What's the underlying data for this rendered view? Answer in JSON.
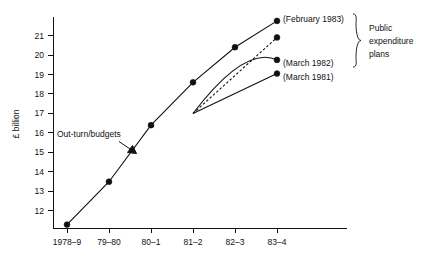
{
  "chart_data": {
    "type": "line",
    "title": "",
    "subtitle": "",
    "xlabel": "",
    "ylabel": "£ billion",
    "categories": [
      "1978–9",
      "79–80",
      "80–1",
      "81–2",
      "82–3",
      "83–4"
    ],
    "x_tick_labels": [
      "1978–9",
      "79–80",
      "80–1",
      "81–2",
      "82–3",
      "83–4"
    ],
    "y_tick_labels": [
      "12",
      "13",
      "14",
      "15",
      "16",
      "17",
      "18",
      "19",
      "20",
      "21"
    ],
    "y_tick_values": [
      12,
      13,
      14,
      15,
      16,
      17,
      18,
      19,
      20,
      21
    ],
    "ylim": [
      11.1,
      21.95
    ],
    "xlim": [
      0,
      5
    ],
    "grid": false,
    "legend_position": "right-inline",
    "series": [
      {
        "name": "Out-turn/budgets",
        "style": "solid",
        "x": [
          "1978–9",
          "79–80",
          "80–1",
          "81–2",
          "82–3",
          "83–4"
        ],
        "values": [
          11.3,
          13.5,
          16.4,
          18.6,
          20.4,
          21.75
        ],
        "end_label": "(February 1983)"
      },
      {
        "name": "(February 1983) plan branch",
        "style": "dashed",
        "x": [
          "81–2",
          "83–4"
        ],
        "values": [
          17.0,
          20.9
        ],
        "end_label": ""
      },
      {
        "name": "(March 1982)",
        "style": "solid-curved",
        "x": [
          "81–2",
          "83–4"
        ],
        "values": [
          17.0,
          19.75
        ],
        "end_label": "(March 1982)"
      },
      {
        "name": "(March 1981)",
        "style": "solid",
        "x": [
          "81–2",
          "83–4"
        ],
        "values": [
          17.0,
          19.05
        ],
        "end_label": "(March 1981)"
      }
    ],
    "annotations": [
      {
        "name": "out-turn-budgets",
        "text": "Out-turn/budgets",
        "target": "main-line between 79–80 and 80–1",
        "arrow": true
      },
      {
        "name": "public-expenditure-plans",
        "text_lines": [
          "Public",
          "expenditure",
          "plans"
        ],
        "brace": true
      }
    ]
  },
  "labels": {
    "y_axis_title": "£ billion",
    "annotation_outturn": "Out-turn/budgets",
    "series_feb_1983": "(February 1983)",
    "series_mar_1982": "(March 1982)",
    "series_mar_1981": "(March 1981)",
    "brace_line1": "Public",
    "brace_line2": "expenditure",
    "brace_line3": "plans"
  },
  "colors": {
    "background": "#ffffff",
    "ink": "#111111",
    "line": "#111111",
    "marker": "#111111"
  }
}
